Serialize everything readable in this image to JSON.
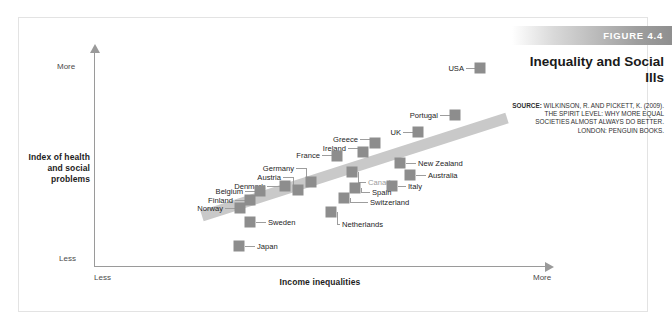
{
  "figure": {
    "band_label": "FIGURE 4.4",
    "title": "Inequality and Social Ills",
    "source_prefix": "SOURCE:",
    "source_text": " WILKINSON, R. AND PICKETT, K. (2009). THE SPIRIT LEVEL: WHY MORE EQUAL SOCIETIES ALMOST ALWAYS DO BETTER. LONDON: PENGUIN BOOKS.",
    "band_color": "#9e9e9e",
    "marker_color": "#8d8d8d",
    "trend_color": "#c9c9c9"
  },
  "axes": {
    "y_title": "Index of health and social problems",
    "x_title": "Income inequalities",
    "y_top_label": "More",
    "y_bottom_label": "Less",
    "x_left_label": "Less",
    "x_right_label": "More"
  },
  "chart_data": {
    "type": "scatter",
    "title": "Inequality and Social Ills",
    "xlabel": "Income inequalities",
    "ylabel": "Index of health and social problems",
    "xlim": [
      "Less",
      "More"
    ],
    "ylim": [
      "Less",
      "More"
    ],
    "grid": false,
    "legend": "none",
    "annotations": [
      "Upward-sloping trend band from lower-left to upper-right"
    ],
    "points": [
      {
        "label": "USA",
        "x": 480,
        "y": 68,
        "label_side": "left",
        "label_x": 464,
        "label_y": 68
      },
      {
        "label": "Portugal",
        "x": 455,
        "y": 115,
        "label_side": "left",
        "label_x": 438,
        "label_y": 115
      },
      {
        "label": "UK",
        "x": 418,
        "y": 132,
        "label_side": "left",
        "label_x": 401,
        "label_y": 132
      },
      {
        "label": "Greece",
        "x": 375,
        "y": 143,
        "label_side": "left",
        "label_x": 358,
        "label_y": 139
      },
      {
        "label": "Ireland",
        "x": 363,
        "y": 152,
        "label_side": "left",
        "label_x": 346,
        "label_y": 148
      },
      {
        "label": "France",
        "x": 337,
        "y": 156,
        "label_side": "left",
        "label_x": 320,
        "label_y": 155
      },
      {
        "label": "New Zealand",
        "x": 400,
        "y": 163,
        "label_side": "right",
        "label_x": 418,
        "label_y": 163
      },
      {
        "label": "Canada",
        "x": 352,
        "y": 172,
        "label_side": "right",
        "label_x": 368,
        "label_y": 182,
        "muted": true
      },
      {
        "label": "Australia",
        "x": 410,
        "y": 175,
        "label_side": "right",
        "label_x": 428,
        "label_y": 175
      },
      {
        "label": "Germany",
        "x": 311,
        "y": 182,
        "label_side": "left",
        "label_x": 294,
        "label_y": 168
      },
      {
        "label": "Italy",
        "x": 392,
        "y": 186,
        "label_side": "right",
        "label_x": 408,
        "label_y": 186
      },
      {
        "label": "Spain",
        "x": 355,
        "y": 188,
        "label_side": "right",
        "label_x": 372,
        "label_y": 192
      },
      {
        "label": "Austria",
        "x": 298,
        "y": 190,
        "label_side": "left",
        "label_x": 281,
        "label_y": 177
      },
      {
        "label": "Denmark",
        "x": 285,
        "y": 186,
        "label_side": "left",
        "label_x": 265,
        "label_y": 186
      },
      {
        "label": "Switzerland",
        "x": 344,
        "y": 198,
        "label_side": "right",
        "label_x": 370,
        "label_y": 202
      },
      {
        "label": "Belgium",
        "x": 260,
        "y": 191,
        "label_side": "left",
        "label_x": 243,
        "label_y": 191
      },
      {
        "label": "Finland",
        "x": 250,
        "y": 200,
        "label_side": "left",
        "label_x": 233,
        "label_y": 200
      },
      {
        "label": "Norway",
        "x": 240,
        "y": 208,
        "label_side": "left",
        "label_x": 223,
        "label_y": 208
      },
      {
        "label": "Netherlands",
        "x": 331,
        "y": 212,
        "label_side": "right",
        "label_x": 342,
        "label_y": 224
      },
      {
        "label": "Sweden",
        "x": 250,
        "y": 222,
        "label_side": "right",
        "label_x": 268,
        "label_y": 222
      },
      {
        "label": "Japan",
        "x": 239,
        "y": 246,
        "label_side": "right",
        "label_x": 257,
        "label_y": 246
      }
    ]
  }
}
